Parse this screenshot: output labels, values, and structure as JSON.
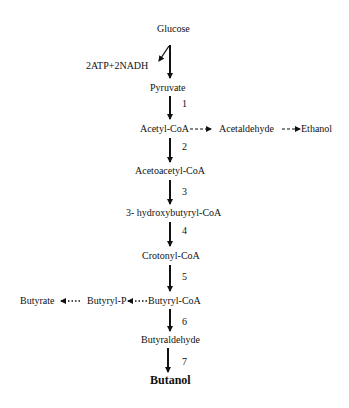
{
  "diagram": {
    "nodes": {
      "glucose": "Glucose",
      "atp_nadh": "2ATP+2NADH",
      "pyruvate": "Pyruvate",
      "acetyl_coa": "Acetyl-CoA",
      "acetaldehyde": "Acetaldehyde",
      "ethanol": "Ethanol",
      "acetoacetyl_coa": "Acetoacetyl-CoA",
      "hydroxybutyryl_coa": "3- hydroxybutyryl-CoA",
      "crotonyl_coa": "Crotonyl-CoA",
      "butyryl_coa": "Butyryl-CoA",
      "butyryl_p": "Butyryl-P",
      "butyrate": "Butyrate",
      "butyraldehyde": "Butyraldehyde",
      "butanol": "Butanol"
    },
    "steps": [
      "1",
      "2",
      "3",
      "4",
      "5",
      "6",
      "7"
    ],
    "edges": [
      {
        "from": "Glucose",
        "to": "Pyruvate",
        "style": "solid"
      },
      {
        "from": "Glucose",
        "to": "2ATP+2NADH",
        "style": "solid-branch"
      },
      {
        "from": "Pyruvate",
        "to": "Acetyl-CoA",
        "style": "solid",
        "step": "1"
      },
      {
        "from": "Acetyl-CoA",
        "to": "Acetaldehyde",
        "style": "dashed"
      },
      {
        "from": "Acetaldehyde",
        "to": "Ethanol",
        "style": "dashed"
      },
      {
        "from": "Acetyl-CoA",
        "to": "Acetoacetyl-CoA",
        "style": "solid",
        "step": "2"
      },
      {
        "from": "Acetoacetyl-CoA",
        "to": "3- hydroxybutyryl-CoA",
        "style": "solid",
        "step": "3"
      },
      {
        "from": "3- hydroxybutyryl-CoA",
        "to": "Crotonyl-CoA",
        "style": "solid",
        "step": "4"
      },
      {
        "from": "Crotonyl-CoA",
        "to": "Butyryl-CoA",
        "style": "solid",
        "step": "5"
      },
      {
        "from": "Butyryl-CoA",
        "to": "Butyryl-P",
        "style": "dotted"
      },
      {
        "from": "Butyryl-P",
        "to": "Butyrate",
        "style": "dotted"
      },
      {
        "from": "Butyryl-CoA",
        "to": "Butyraldehyde",
        "style": "solid",
        "step": "6"
      },
      {
        "from": "Butyraldehyde",
        "to": "Butanol",
        "style": "solid",
        "step": "7"
      }
    ]
  }
}
